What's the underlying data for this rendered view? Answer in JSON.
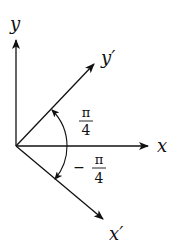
{
  "diagram": {
    "type": "coordinate-rotation",
    "axes": {
      "x": {
        "label": "x"
      },
      "y": {
        "label": "y"
      },
      "x_prime": {
        "label": "x′"
      },
      "y_prime": {
        "label": "y′"
      }
    },
    "angles": {
      "upper": {
        "numerator": "π",
        "denominator": "4",
        "sign": ""
      },
      "lower": {
        "numerator": "π",
        "denominator": "4",
        "sign": "−"
      }
    },
    "colors": {
      "stroke": "#111111",
      "background": "#ffffff"
    }
  }
}
